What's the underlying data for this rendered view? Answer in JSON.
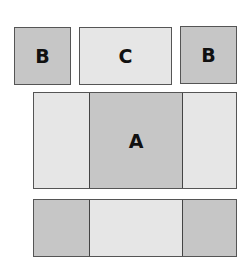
{
  "top_row": {
    "boxes": [
      {
        "label": "B",
        "shade": "dark"
      },
      {
        "label": "C",
        "shade": "light"
      },
      {
        "label": "B",
        "shade": "dark"
      }
    ]
  },
  "middle_row": {
    "cells": [
      {
        "label": "",
        "shade": "light"
      },
      {
        "label": "A",
        "shade": "dark"
      },
      {
        "label": "",
        "shade": "light"
      }
    ]
  },
  "bottom_row": {
    "cells": [
      {
        "label": "",
        "shade": "dark"
      },
      {
        "label": "",
        "shade": "light"
      },
      {
        "label": "",
        "shade": "dark"
      }
    ]
  },
  "colors": {
    "dark": "#c6c6c6",
    "light": "#e6e6e6",
    "border": "#555555"
  }
}
